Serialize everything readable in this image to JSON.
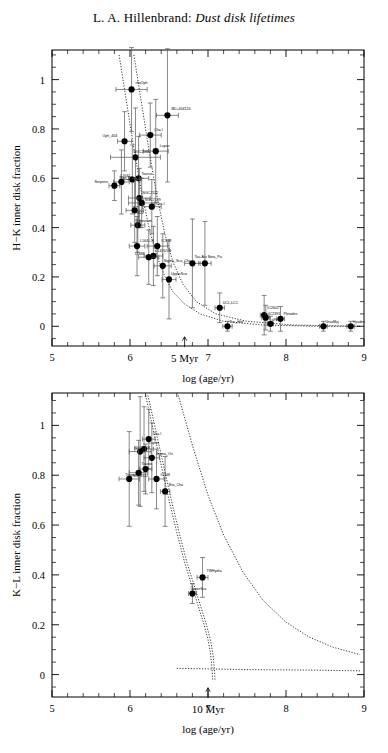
{
  "title": {
    "author": "L. A. Hillenbrand:",
    "subject": "Dust disk lifetimes"
  },
  "chart_data": [
    {
      "type": "scatter",
      "panel": "top",
      "title": "",
      "xlabel": "log (age/yr)",
      "ylabel": "H−K inner disk fraction",
      "xlim": [
        5,
        9
      ],
      "ylim": [
        -0.08,
        1.12
      ],
      "xticks": [
        5,
        6,
        7,
        8,
        9
      ],
      "yticks": [
        0,
        0.2,
        0.4,
        0.6,
        0.8,
        1
      ],
      "xticklabels": [
        "5",
        "6",
        "7",
        "8",
        "9"
      ],
      "yticklabels": [
        "0",
        "0.2",
        "0.4",
        "0.6",
        "0.8",
        "1"
      ],
      "grid": false,
      "legend": null,
      "annotation": {
        "text": "5 Myr",
        "x": 6.7,
        "y": -0.04,
        "arrow": "up"
      },
      "points": [
        {
          "label": "rhoOph",
          "x": 6.02,
          "y": 0.96,
          "xerr": 0.2,
          "yerr": 0.17,
          "lx": 4,
          "ly": -5
        },
        {
          "label": "BD+404124",
          "x": 6.48,
          "y": 0.855,
          "xerr": 0.14,
          "yerr": 0.27,
          "lx": 4,
          "ly": -5
        },
        {
          "label": "Cha I",
          "x": 6.26,
          "y": 0.775,
          "xerr": 0.14,
          "yerr": 0.13,
          "lx": 4,
          "ly": -4
        },
        {
          "label": "Oph_404",
          "x": 5.93,
          "y": 0.75,
          "xerr": 0.09,
          "yerr": 0.12,
          "lx": -22,
          "ly": -4
        },
        {
          "label": "Lupus",
          "x": 6.33,
          "y": 0.71,
          "xerr": 0.16,
          "yerr": 0.21,
          "lx": 4,
          "ly": -4
        },
        {
          "label": "NGC2068",
          "x": 6.07,
          "y": 0.685,
          "xerr": 0.32,
          "yerr": 0.2,
          "lx": -2,
          "ly": -4
        },
        {
          "label": "Taurus",
          "x": 6.11,
          "y": 0.6,
          "xerr": 0.13,
          "yerr": 0.17,
          "lx": 3,
          "ly": -3
        },
        {
          "label": "L1641",
          "x": 6.03,
          "y": 0.595,
          "xerr": 0.11,
          "yerr": 0.14,
          "lx": -12,
          "ly": -3
        },
        {
          "label": "Mon_R2",
          "x": 5.89,
          "y": 0.585,
          "xerr": 0.1,
          "yerr": 0.13,
          "lx": -2,
          "ly": -3
        },
        {
          "label": "Serpens",
          "x": 5.8,
          "y": 0.57,
          "xerr": 0.07,
          "yerr": 0.06,
          "lx": -20,
          "ly": -3
        },
        {
          "label": "NGC2112",
          "x": 6.12,
          "y": 0.52,
          "xerr": 0.14,
          "yerr": 0.12,
          "lx": 3,
          "ly": -4
        },
        {
          "label": "NGC7129",
          "x": 6.15,
          "y": 0.5,
          "xerr": 0.17,
          "yerr": 0.1,
          "lx": 3,
          "ly": -2
        },
        {
          "label": "Cha I",
          "x": 6.28,
          "y": 0.485,
          "xerr": 0.12,
          "yerr": 0.11,
          "lx": 4,
          "ly": -2
        },
        {
          "label": "M22",
          "x": 6.06,
          "y": 0.47,
          "xerr": 0.11,
          "yerr": 0.13,
          "lx": 2,
          "ly": 4
        },
        {
          "label": "Trapezium",
          "x": 6.1,
          "y": 0.41,
          "xerr": 0.09,
          "yerr": 0.11,
          "lx": -3,
          "ly": -3
        },
        {
          "label": "L1641-N",
          "x": 6.09,
          "y": 0.325,
          "xerr": 0.1,
          "yerr": 0.12,
          "lx": 3,
          "ly": -4
        },
        {
          "label": "IC348",
          "x": 6.35,
          "y": 0.325,
          "xerr": 0.13,
          "yerr": 0.12,
          "lx": 4,
          "ly": -4
        },
        {
          "label": "L1495/VB",
          "x": 6.3,
          "y": 0.285,
          "xerr": 0.12,
          "yerr": 0.12,
          "lx": 2,
          "ly": -4
        },
        {
          "label": "L1688",
          "x": 6.24,
          "y": 0.28,
          "xerr": 0.13,
          "yerr": 0.11,
          "lx": -14,
          "ly": -2
        },
        {
          "label": "Sigma_Sco_Cha",
          "x": 6.42,
          "y": 0.245,
          "xerr": 0.11,
          "yerr": 0.13,
          "lx": 1,
          "ly": -4
        },
        {
          "label": "Tau-Aur",
          "x": 6.8,
          "y": 0.255,
          "xerr": 0.1,
          "yerr": 0.18,
          "lx": 2,
          "ly": -5
        },
        {
          "label": "Beta_Pic",
          "x": 6.96,
          "y": 0.255,
          "xerr": 0.08,
          "yerr": 0.17,
          "lx": 3,
          "ly": -5
        },
        {
          "label": "UpperSco",
          "x": 6.5,
          "y": 0.19,
          "xerr": 0.09,
          "yerr": 0.16,
          "lx": 2,
          "ly": -4
        },
        {
          "label": "UCL,LCC",
          "x": 7.15,
          "y": 0.075,
          "xerr": 0.06,
          "yerr": 0.06,
          "lx": 3,
          "ly": -4
        },
        {
          "label": "IC2602",
          "x": 7.72,
          "y": 0.045,
          "xerr": 0.05,
          "yerr": 0.08,
          "lx": 3,
          "ly": -6
        },
        {
          "label": "IC2391",
          "x": 7.74,
          "y": 0.035,
          "xerr": 0.05,
          "yerr": 0.05,
          "lx": 3,
          "ly": -3
        },
        {
          "label": "Pleiades",
          "x": 7.93,
          "y": 0.03,
          "xerr": 0.05,
          "yerr": 0.05,
          "lx": 3,
          "ly": -4
        },
        {
          "label": "aPer",
          "x": 7.8,
          "y": 0.01,
          "xerr": 0.04,
          "yerr": 0.03,
          "lx": 1,
          "ly": -3
        },
        {
          "label": "Tuc_Hor",
          "x": 7.25,
          "y": 0.0,
          "xerr": 0.06,
          "yerr": 0.02,
          "lx": 2,
          "ly": -3
        },
        {
          "label": "UrsaMaj",
          "x": 8.48,
          "y": 0.0,
          "xerr": 0.05,
          "yerr": 0.02,
          "lx": 2,
          "ly": -3
        },
        {
          "label": "Hyades",
          "x": 8.83,
          "y": 0.0,
          "xerr": 0.05,
          "yerr": 0.02,
          "lx": 2,
          "ly": -3
        }
      ],
      "curves": [
        {
          "name": "decay-a",
          "pts": [
            [
              5.86,
              1.1
            ],
            [
              5.95,
              0.92
            ],
            [
              6.05,
              0.72
            ],
            [
              6.15,
              0.54
            ],
            [
              6.25,
              0.39
            ],
            [
              6.35,
              0.28
            ],
            [
              6.45,
              0.2
            ],
            [
              6.55,
              0.14
            ],
            [
              6.7,
              0.09
            ],
            [
              6.9,
              0.05
            ],
            [
              7.2,
              0.02
            ],
            [
              7.7,
              0.005
            ],
            [
              8.4,
              0.0
            ],
            [
              8.95,
              0.0
            ]
          ]
        },
        {
          "name": "decay-b",
          "pts": [
            [
              6.05,
              1.1
            ],
            [
              6.15,
              0.9
            ],
            [
              6.25,
              0.7
            ],
            [
              6.35,
              0.52
            ],
            [
              6.45,
              0.37
            ],
            [
              6.55,
              0.26
            ],
            [
              6.68,
              0.17
            ],
            [
              6.85,
              0.1
            ],
            [
              7.1,
              0.05
            ],
            [
              7.5,
              0.02
            ],
            [
              8.1,
              0.005
            ],
            [
              8.95,
              0.0
            ]
          ]
        }
      ]
    },
    {
      "type": "scatter",
      "panel": "bottom",
      "title": "",
      "xlabel": "log (age/yr)",
      "ylabel": "K−L inner disk fraction",
      "xlim": [
        5,
        9
      ],
      "ylim": [
        -0.09,
        1.13
      ],
      "xticks": [
        5,
        6,
        7,
        8,
        9
      ],
      "yticks": [
        0,
        0.2,
        0.4,
        0.6,
        0.8,
        1
      ],
      "xticklabels": [
        "5",
        "6",
        "7",
        "8",
        "9"
      ],
      "yticklabels": [
        "0",
        "0.2",
        "0.4",
        "0.6",
        "0.8",
        "1"
      ],
      "grid": false,
      "legend": null,
      "annotation": {
        "text": "10 Myr",
        "x": 7.0,
        "y": -0.05,
        "arrow": "up"
      },
      "points": [
        {
          "label": "Cha I",
          "x": 6.24,
          "y": 0.945,
          "xerr": 0.08,
          "yerr": 0.12,
          "lx": 4,
          "ly": -4
        },
        {
          "label": "Lupus",
          "x": 6.18,
          "y": 0.905,
          "xerr": 0.12,
          "yerr": 0.17,
          "lx": 5,
          "ly": -5
        },
        {
          "label": "NGC2068",
          "x": 6.13,
          "y": 0.895,
          "xerr": 0.14,
          "yerr": 0.22,
          "lx": -6,
          "ly": -3
        },
        {
          "label": "Sigma_Ori",
          "x": 6.28,
          "y": 0.87,
          "xerr": 0.1,
          "yerr": 0.14,
          "lx": 4,
          "ly": -3
        },
        {
          "label": "Taurus",
          "x": 6.2,
          "y": 0.825,
          "xerr": 0.08,
          "yerr": 0.1,
          "lx": -4,
          "ly": -4
        },
        {
          "label": "NGC2112",
          "x": 6.11,
          "y": 0.81,
          "xerr": 0.12,
          "yerr": 0.13,
          "lx": -6,
          "ly": 4
        },
        {
          "label": "IC348",
          "x": 6.34,
          "y": 0.785,
          "xerr": 0.1,
          "yerr": 0.12,
          "lx": 4,
          "ly": -3
        },
        {
          "label": "Trapezium",
          "x": 5.99,
          "y": 0.785,
          "xerr": 0.13,
          "yerr": 0.19,
          "lx": -4,
          "ly": -3
        },
        {
          "label": "Eta_Cha",
          "x": 6.45,
          "y": 0.735,
          "xerr": 0.06,
          "yerr": 0.14,
          "lx": 4,
          "ly": -5
        },
        {
          "label": "TWHydra",
          "x": 6.93,
          "y": 0.39,
          "xerr": 0.07,
          "yerr": 0.08,
          "lx": 4,
          "ly": -5
        },
        {
          "label": "UpperSco",
          "x": 6.8,
          "y": 0.325,
          "xerr": 0.05,
          "yerr": 0.04,
          "lx": -2,
          "ly": -4
        }
      ],
      "curves": [
        {
          "name": "decay-a",
          "pts": [
            [
              6.2,
              1.12
            ],
            [
              6.3,
              0.98
            ],
            [
              6.4,
              0.84
            ],
            [
              6.5,
              0.7
            ],
            [
              6.6,
              0.57
            ],
            [
              6.7,
              0.45
            ],
            [
              6.8,
              0.35
            ],
            [
              6.88,
              0.27
            ],
            [
              6.95,
              0.2
            ],
            [
              7.0,
              0.14
            ],
            [
              7.03,
              0.09
            ],
            [
              7.05,
              0.03
            ],
            [
              7.06,
              -0.02
            ]
          ]
        },
        {
          "name": "decay-b",
          "pts": [
            [
              6.23,
              1.12
            ],
            [
              6.33,
              0.98
            ],
            [
              6.43,
              0.84
            ],
            [
              6.53,
              0.7
            ],
            [
              6.63,
              0.57
            ],
            [
              6.73,
              0.45
            ],
            [
              6.83,
              0.35
            ],
            [
              6.91,
              0.27
            ],
            [
              6.98,
              0.2
            ],
            [
              7.03,
              0.14
            ],
            [
              7.06,
              0.09
            ],
            [
              7.08,
              0.03
            ],
            [
              7.09,
              -0.02
            ]
          ]
        },
        {
          "name": "slow-decay",
          "pts": [
            [
              6.62,
              1.12
            ],
            [
              6.8,
              0.92
            ],
            [
              7.0,
              0.72
            ],
            [
              7.2,
              0.56
            ],
            [
              7.45,
              0.41
            ],
            [
              7.7,
              0.3
            ],
            [
              8.0,
              0.21
            ],
            [
              8.3,
              0.15
            ],
            [
              8.6,
              0.11
            ],
            [
              8.95,
              0.08
            ]
          ]
        },
        {
          "name": "floor",
          "pts": [
            [
              6.6,
              0.025
            ],
            [
              7.5,
              0.02
            ],
            [
              8.3,
              0.018
            ],
            [
              8.95,
              0.015
            ]
          ]
        }
      ]
    }
  ]
}
